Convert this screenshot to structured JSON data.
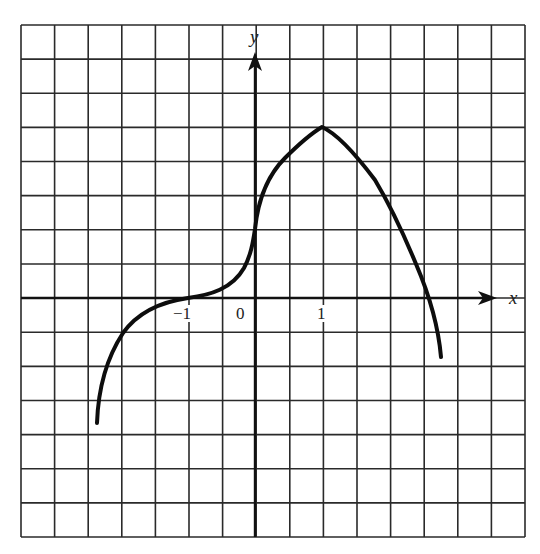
{
  "chart_data": {
    "type": "line",
    "title": "",
    "xlabel": "x",
    "ylabel": "y",
    "x_tick_labels": [
      "-1",
      "0",
      "1"
    ],
    "grid": true,
    "grid_cells": {
      "columns": 15,
      "rows": 15
    },
    "units_per_x_label": "1 unit = 2 grid cells",
    "xlim": [
      -3.5,
      4.0
    ],
    "ylim": [
      -3.5,
      3.5
    ],
    "series": [
      {
        "name": "f(x)",
        "description": "Curve rises from lower left, horizontal inflection at x=-1 on x-axis, steep rise through y-axis, maximum (cusp-like peak) at x=1, then decreases, crossing x-axis near x=2.5 and ending below the axis.",
        "x": [
          -2.35,
          -2.25,
          -2.0,
          -1.5,
          -1.0,
          -0.5,
          -0.15,
          0.0,
          0.25,
          0.5,
          1.0,
          1.5,
          1.95,
          2.1,
          2.4,
          2.55,
          2.78
        ],
        "y": [
          -1.85,
          -1.05,
          -0.55,
          -0.25,
          0.0,
          0.16,
          0.5,
          1.02,
          1.6,
          1.9,
          2.55,
          2.05,
          1.53,
          1.02,
          0.5,
          0.0,
          -0.88
        ]
      }
    ],
    "key_points": [
      {
        "label": "inflection",
        "x": -1,
        "y": 0
      },
      {
        "label": "y-intercept",
        "x": 0,
        "y": 1.0
      },
      {
        "label": "maximum",
        "x": 1,
        "y": 2.55
      },
      {
        "label": "x-intercept",
        "x": 2.55,
        "y": 0
      }
    ]
  },
  "labels": {
    "x_axis": "x",
    "y_axis": "y",
    "tick_neg1": "−1",
    "tick_0": "0",
    "tick_1": "1"
  },
  "colors": {
    "grid": "#2a2a2a",
    "curve": "#0d0d0d",
    "background": "#ffffff"
  }
}
